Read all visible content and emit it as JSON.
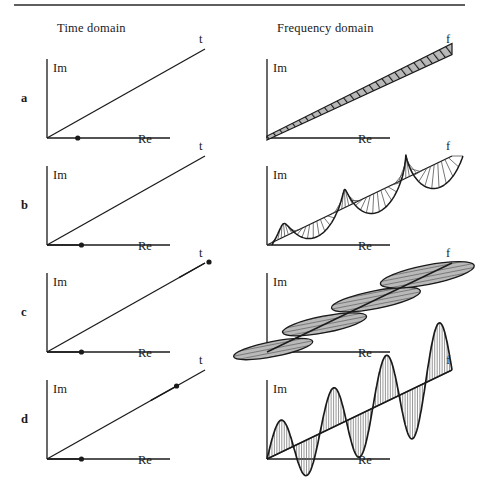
{
  "figure": {
    "title_left": "Time domain",
    "title_right": "Frequency domain",
    "top_rule": true,
    "background": "#ffffff",
    "ink": "#1a1a1a",
    "shade": "#b3b3b3"
  },
  "axes": {
    "imaginary_label": "Im",
    "real_label": "Re",
    "time_label": "t",
    "frequency_label": "f"
  },
  "rows": [
    {
      "label": "a",
      "time": {
        "phasor_dot_fraction": 0.25,
        "phasor_arrow": false,
        "dot_on_axis": "Re"
      },
      "freq": {
        "kind": "band",
        "hatch": "diagonal",
        "cycles": 0,
        "amplitude": 0
      }
    },
    {
      "label": "b",
      "time": {
        "phasor_dot_fraction": 0.28,
        "phasor_arrow": true,
        "dot_on_axis": "Re"
      },
      "freq": {
        "kind": "helix",
        "hatch": "radial-spokes",
        "cycles": 3,
        "amplitude": 26
      }
    },
    {
      "label": "c",
      "time": {
        "phasor_dot_fraction": 0.28,
        "phasor_arrow": true,
        "dot_on_axis": "t",
        "dot_t_fraction": 1.0
      },
      "freq": {
        "kind": "flat-helix",
        "hatch": "horizontal",
        "cycles": 3,
        "amplitude": 30
      }
    },
    {
      "label": "d",
      "time": {
        "phasor_dot_fraction": 0.28,
        "phasor_arrow": true,
        "dot_on_axis": "t",
        "dot_t_fraction": 0.82
      },
      "freq": {
        "kind": "sine",
        "hatch": "vertical",
        "cycles": 3.5,
        "amplitude": 55
      }
    }
  ],
  "chart_data": {
    "type": "line",
    "xlabel": "Re",
    "ylabel": "Im",
    "series": [
      {
        "name": "a",
        "description": "static phasor / hatched band",
        "cycles": 0
      },
      {
        "name": "b",
        "description": "slow helix",
        "cycles": 3
      },
      {
        "name": "c",
        "description": "flattened helix",
        "cycles": 3
      },
      {
        "name": "d",
        "description": "planar sine wave",
        "cycles": 3.5
      }
    ]
  }
}
